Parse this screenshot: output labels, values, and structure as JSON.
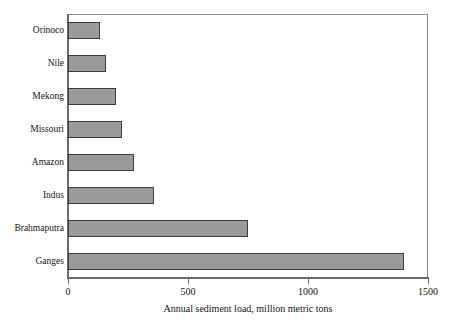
{
  "chart_data": {
    "type": "bar",
    "orientation": "horizontal",
    "title": "",
    "xlabel": "Annual sediment load, million metric tons",
    "ylabel": "",
    "xlim": [
      0,
      1500
    ],
    "xticks": [
      0,
      500,
      1000,
      1500
    ],
    "xtick_labels": [
      "0",
      "500",
      "1000",
      "1500"
    ],
    "grid": false,
    "legend": null,
    "bar_color": "#9a9a9a",
    "bar_edge_color": "#3d3d3d",
    "axis_color": "#6b6b6b",
    "categories": [
      "Orinoco",
      "Nile",
      "Mekong",
      "Missouri",
      "Amazon",
      "Indus",
      "Brahmaputra",
      "Ganges"
    ],
    "values": [
      133,
      160,
      200,
      225,
      275,
      360,
      750,
      1400
    ],
    "series": [
      {
        "name": "Annual sediment load",
        "values": [
          133,
          160,
          200,
          225,
          275,
          360,
          750,
          1400
        ]
      }
    ],
    "points": [
      {
        "category": "Orinoco",
        "value": 133
      },
      {
        "category": "Nile",
        "value": 160
      },
      {
        "category": "Mekong",
        "value": 200
      },
      {
        "category": "Missouri",
        "value": 225
      },
      {
        "category": "Amazon",
        "value": 275
      },
      {
        "category": "Indus",
        "value": 360
      },
      {
        "category": "Brahmaputra",
        "value": 750
      },
      {
        "category": "Ganges",
        "value": 1400
      }
    ]
  }
}
